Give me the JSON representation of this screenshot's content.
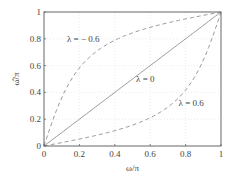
{
  "chart_data": {
    "type": "line",
    "title": "",
    "xlabel": "ω/π",
    "ylabel": "ω̂/π",
    "xlim": [
      0,
      1
    ],
    "ylim": [
      0,
      1
    ],
    "xticks": [
      "0",
      "0.2",
      "0.4",
      "0.6",
      "0.8",
      "1"
    ],
    "yticks": [
      "0",
      "0.2",
      "0.4",
      "0.6",
      "0.8",
      "1"
    ],
    "grid": true,
    "series": [
      {
        "name": "λ = − 0.6",
        "style": "dashed",
        "lambda": -0.6
      },
      {
        "name": "λ = 0",
        "style": "solid",
        "lambda": 0
      },
      {
        "name": "λ = 0.6",
        "style": "dashed",
        "lambda": 0.6
      }
    ],
    "annotations": [
      {
        "text": "λ = − 0.6",
        "x": 0.13,
        "y": 0.8
      },
      {
        "text": "λ = 0",
        "x": 0.52,
        "y": 0.5
      },
      {
        "text": "λ = 0.6",
        "x": 0.76,
        "y": 0.32
      }
    ]
  }
}
